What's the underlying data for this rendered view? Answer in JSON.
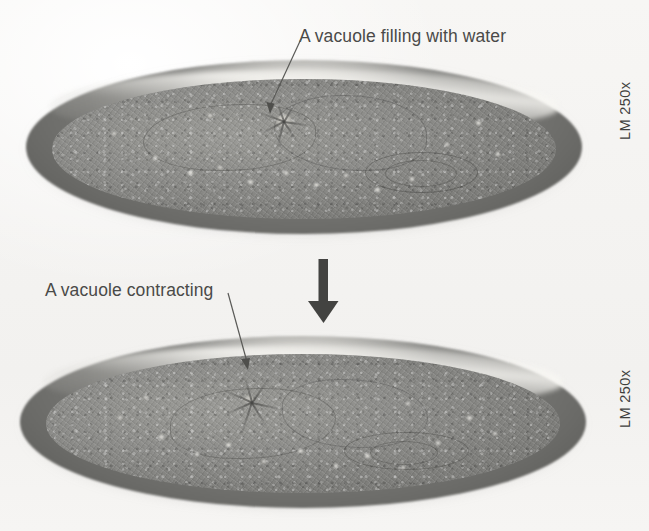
{
  "figure": {
    "header_fragment": "",
    "background_color": "#f6f5f3",
    "annotations": [
      {
        "id": "top",
        "text": "A vacuole filling with water",
        "points_to": "contractile-vacuole-filling"
      },
      {
        "id": "bottom",
        "text": "A vacuole contracting",
        "points_to": "contractile-vacuole-contracting"
      }
    ],
    "magnification_labels": [
      {
        "id": "top",
        "text": "LM 250x"
      },
      {
        "id": "bottom",
        "text": "LM 250x"
      }
    ],
    "transition_arrow": {
      "direction": "down",
      "name": "sequence-arrow"
    },
    "panels": [
      {
        "id": "top-micrograph",
        "caption": "Paramecium with contractile vacuole filling with water",
        "magnification": "LM 250x"
      },
      {
        "id": "bottom-micrograph",
        "caption": "Paramecium with contractile vacuole contracting",
        "magnification": "LM 250x"
      }
    ],
    "colors": {
      "text": "#4a4a48",
      "label": "#3f3f3d",
      "cell_body": "#8c8c89",
      "rim": "#636360",
      "background": "#f6f5f3"
    }
  }
}
